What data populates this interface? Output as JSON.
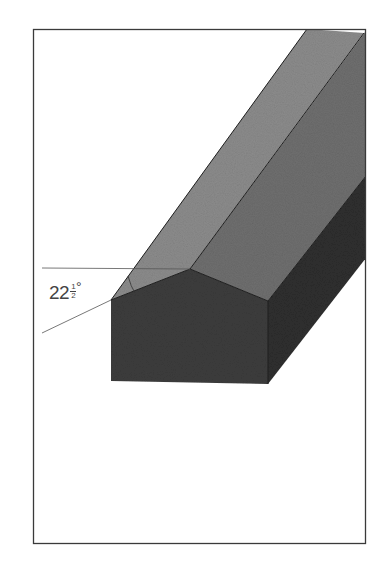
{
  "figure": {
    "frame": {
      "x": 33,
      "y": 29,
      "width": 333,
      "height": 515,
      "stroke": "#3a3a3a"
    },
    "annotation": {
      "angle_whole": "22",
      "angle_numerator": "1",
      "angle_denominator": "2",
      "degree_symbol": "°",
      "angle_value_deg": 22.5
    },
    "colors": {
      "background": "#ffffff",
      "left_roof_face": "#8a8a8a",
      "right_roof_face": "#6e6e6e",
      "gable_end_face": "#3c3c3c",
      "side_wall_face": "#2e2e2e",
      "edge_line": "#1e1e1e",
      "reference_line": "#555555"
    }
  }
}
